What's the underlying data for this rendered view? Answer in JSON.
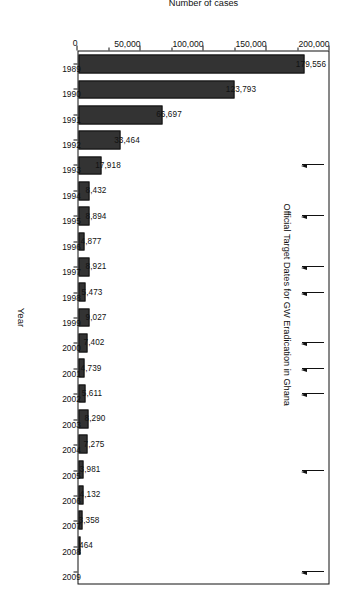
{
  "chart_data": {
    "type": "bar",
    "title": "",
    "xlabel": "Year",
    "ylabel": "Number of cases",
    "ylim": [
      0,
      200000
    ],
    "grid": false,
    "legend": "none",
    "orientation": "vertical-bars-rotated-90cw",
    "categories": [
      "1989",
      "1990",
      "1991",
      "1992",
      "1993",
      "1994",
      "1995",
      "1996",
      "1997",
      "1998",
      "1999",
      "2000",
      "2001",
      "2002",
      "2003",
      "2004",
      "2005",
      "2006",
      "2007",
      "2008",
      "2009"
    ],
    "values": [
      179556,
      123793,
      66697,
      33464,
      17918,
      8432,
      8894,
      4877,
      8921,
      5473,
      9027,
      7402,
      4739,
      5611,
      8290,
      7275,
      3981,
      4132,
      3358,
      464,
      0
    ],
    "value_labels": [
      "179,556",
      "123,793",
      "66,697",
      "33,464",
      "17,918",
      "8,432",
      "8,894",
      "4,877",
      "8,921",
      "5,473",
      "9,027",
      "7,402",
      "4,739",
      "5,611",
      "8,290",
      "7,275",
      "3,981",
      "4,132",
      "3,358",
      "464",
      ""
    ],
    "ytick_labels": [
      "0",
      "50,000",
      "100,000",
      "150,000",
      "200,000"
    ],
    "ytick_values": [
      0,
      50000,
      100000,
      150000,
      200000
    ],
    "annotations": {
      "caption": "Official Target Dates for GW Eradication in Ghana",
      "arrow_years": [
        "1993",
        "1995",
        "1997",
        "1998",
        "2000",
        "2001",
        "2002",
        "2005",
        "2009"
      ]
    },
    "bar_color": "#333333",
    "axis_color": "#111111"
  }
}
